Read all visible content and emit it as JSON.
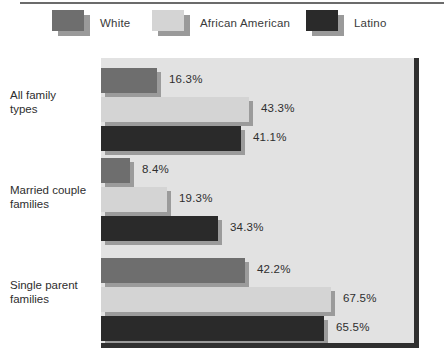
{
  "legend": {
    "items": [
      {
        "label": "White",
        "color": "#6e6e6e"
      },
      {
        "label": "African American",
        "color": "#d4d4d4"
      },
      {
        "label": "Latino",
        "color": "#2a2a2a"
      }
    ]
  },
  "chart_data": {
    "type": "bar",
    "orientation": "horizontal",
    "title": "",
    "xlabel": "",
    "ylabel": "",
    "grid": false,
    "legend_position": "top",
    "xlim": [
      0,
      93
    ],
    "categories": [
      "All family types",
      "Married couple families",
      "Single parent families"
    ],
    "category_lines": [
      [
        "All family",
        "types"
      ],
      [
        "Married couple",
        "families"
      ],
      [
        "Single parent",
        "families"
      ]
    ],
    "series": [
      {
        "name": "White",
        "color": "#6e6e6e",
        "values": [
          16.3,
          8.4,
          42.2
        ],
        "labels": [
          "16.3%",
          "8.4%",
          "42.2%"
        ]
      },
      {
        "name": "African American",
        "color": "#d4d4d4",
        "values": [
          43.3,
          19.3,
          67.5
        ],
        "labels": [
          "43.3%",
          "19.3%",
          "67.5%"
        ]
      },
      {
        "name": "Latino",
        "color": "#2a2a2a",
        "values": [
          41.1,
          34.3,
          65.5
        ],
        "labels": [
          "41.1%",
          "34.3%",
          "65.5%"
        ]
      }
    ]
  },
  "colors": {
    "plot_background": "#e2e2e2",
    "page_background": "#ffffff",
    "axis_line": "#2f2f2f",
    "bar_shadow": "#9b9b9b",
    "text": "#2e2e2e"
  }
}
